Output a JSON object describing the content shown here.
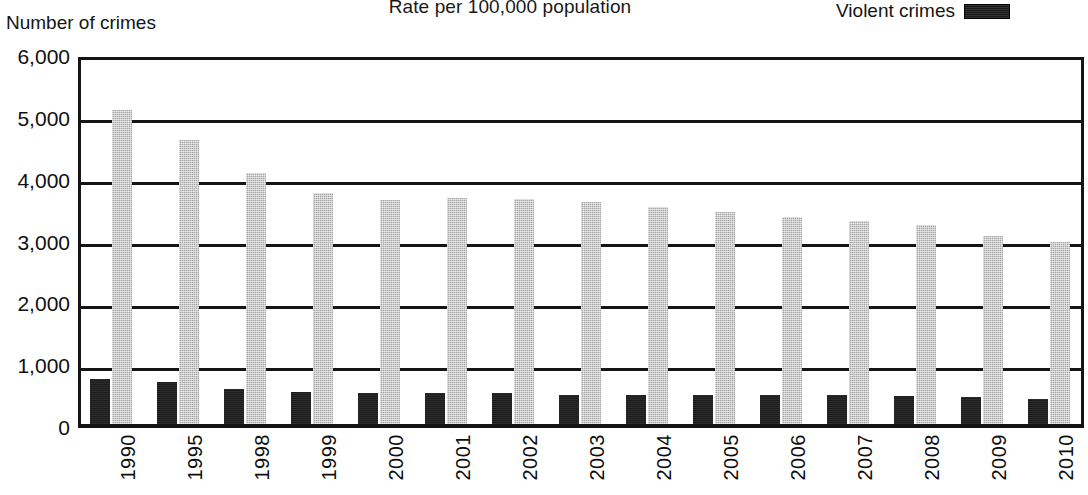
{
  "chart_data": {
    "type": "bar",
    "title": "Rate per 100,000 population",
    "ylabel": "Number of crimes",
    "xlabel": "",
    "ylim": [
      0,
      6000
    ],
    "grid": true,
    "legend_position": "top-right",
    "categories": [
      "1990",
      "1995",
      "1998",
      "1999",
      "2000",
      "2001",
      "2002",
      "2003",
      "2004",
      "2005",
      "2006",
      "2007",
      "2008",
      "2009",
      "2010"
    ],
    "ytick_labels": [
      "6,000",
      "5,000",
      "4,000",
      "3,000",
      "2,000",
      "1,000",
      "0"
    ],
    "ytick_values": [
      6000,
      5000,
      4000,
      3000,
      2000,
      1000,
      0
    ],
    "series": [
      {
        "name": "Violent crimes",
        "color": "#1c1c1c",
        "values": [
          730,
          685,
          568,
          523,
          507,
          505,
          495,
          476,
          463,
          469,
          474,
          467,
          458,
          432,
          404
        ]
      },
      {
        "name": "Property crimes",
        "color": "#a5a5a5",
        "values": [
          5073,
          4591,
          4053,
          3744,
          3618,
          3658,
          3631,
          3591,
          3514,
          3432,
          3347,
          3276,
          3215,
          3041,
          2942
        ]
      }
    ]
  },
  "legend": {
    "entries": [
      {
        "label": "Violent crimes",
        "swatch_color": "#1c1c1c"
      }
    ]
  },
  "header": {
    "title": "Rate per 100,000 population",
    "y_caption": "Number of crimes"
  }
}
